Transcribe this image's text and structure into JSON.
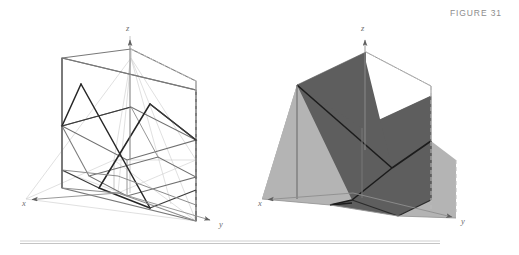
{
  "figure": {
    "caption": "FIGURE 31",
    "width": 519,
    "height": 255,
    "background": "#ffffff"
  },
  "colors": {
    "caption_text": "#8d8d8d",
    "axis_line": "#8f8f8f",
    "axis_label": "#6e6e6e",
    "box_solid_edge": "#6b6b6b",
    "box_dashed_edge": "#b9b9b9",
    "faint_line": "#cfcfcf",
    "mid_line": "#9a9a9a",
    "dark_line": "#2b2b2b",
    "plane_dark_fill": "#5e5e5e",
    "plane_light_fill": "#b4b4b4",
    "rule_line": "#c9c9c9"
  },
  "panels": [
    {
      "id": "left-panel",
      "name": "wireframe-diagram",
      "description": "Wireframe of intersecting planes inside a slab box with x, y, z axes",
      "axes": [
        {
          "name": "x-axis",
          "label": "x",
          "label_x": 22,
          "label_y": 206,
          "from": [
            118,
            193
          ],
          "to": [
            26,
            200
          ]
        },
        {
          "name": "y-axis",
          "label": "y",
          "label_x": 221,
          "label_y": 227,
          "from": [
            118,
            193
          ],
          "to": [
            214,
            221
          ]
        },
        {
          "name": "z-axis",
          "label": "z",
          "label_x": 126,
          "label_y": 30,
          "from": [
            130,
            160
          ],
          "to": [
            130,
            36
          ]
        }
      ]
    },
    {
      "id": "right-panel",
      "name": "shaded-diagram",
      "description": "Same configuration with the two planes rendered as shaded surfaces",
      "axes": [
        {
          "name": "x-axis",
          "label": "x",
          "label_x": 258,
          "label_y": 206,
          "from": [
            353,
            193
          ],
          "to": [
            262,
            200
          ]
        },
        {
          "name": "y-axis",
          "label": "y",
          "label_x": 463,
          "label_y": 224,
          "from": [
            353,
            193
          ],
          "to": [
            456,
            218
          ]
        },
        {
          "name": "z-axis",
          "label": "z",
          "label_x": 361,
          "label_y": 30,
          "from": [
            365,
            160
          ],
          "to": [
            365,
            36
          ]
        }
      ]
    }
  ],
  "rule": {
    "name": "bottom-rule",
    "x1": 20,
    "x2": 440,
    "y": 242
  }
}
